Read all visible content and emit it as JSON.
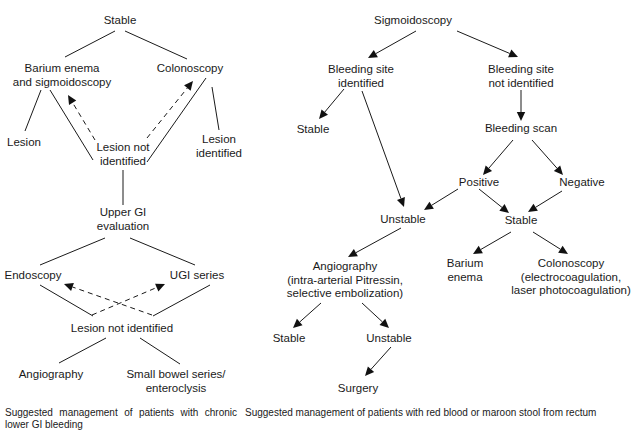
{
  "figures": [
    {
      "id": "left",
      "title": "Chronic lower GI bleeding management",
      "caption": "Suggested management of patients with chronic lower GI bleeding",
      "nodes": [
        {
          "id": "L_stable",
          "lines": [
            "Stable"
          ]
        },
        {
          "id": "L_barium",
          "lines": [
            "Barium enema",
            "and sigmoidoscopy"
          ]
        },
        {
          "id": "L_colon",
          "lines": [
            "Colonoscopy"
          ]
        },
        {
          "id": "L_lesion",
          "lines": [
            "Lesion"
          ]
        },
        {
          "id": "L_lni1",
          "lines": [
            "Lesion not",
            "identified"
          ]
        },
        {
          "id": "L_lid",
          "lines": [
            "Lesion",
            "identified"
          ]
        },
        {
          "id": "L_ugi",
          "lines": [
            "Upper GI",
            "evaluation"
          ]
        },
        {
          "id": "L_endo",
          "lines": [
            "Endoscopy"
          ]
        },
        {
          "id": "L_ugiser",
          "lines": [
            "UGI series"
          ]
        },
        {
          "id": "L_lni2",
          "lines": [
            "Lesion not identified"
          ]
        },
        {
          "id": "L_angio",
          "lines": [
            "Angiography"
          ]
        },
        {
          "id": "L_sbs",
          "lines": [
            "Small bowel series/",
            "enteroclysis"
          ]
        }
      ],
      "edges": [
        {
          "from": "L_stable",
          "to": "L_barium",
          "style": "solid",
          "arrow": false
        },
        {
          "from": "L_stable",
          "to": "L_colon",
          "style": "solid",
          "arrow": false
        },
        {
          "from": "L_barium",
          "to": "L_lesion",
          "style": "solid",
          "arrow": false
        },
        {
          "from": "L_barium",
          "to": "L_lni1",
          "style": "solid",
          "arrow": false
        },
        {
          "from": "L_colon",
          "to": "L_lni1",
          "style": "solid",
          "arrow": false
        },
        {
          "from": "L_colon",
          "to": "L_lid",
          "style": "solid",
          "arrow": false
        },
        {
          "from": "L_lni1",
          "to": "L_barium",
          "style": "dashed",
          "arrow": true
        },
        {
          "from": "L_lni1",
          "to": "L_colon",
          "style": "dashed",
          "arrow": true
        },
        {
          "from": "L_lni1",
          "to": "L_ugi",
          "style": "solid",
          "arrow": false
        },
        {
          "from": "L_ugi",
          "to": "L_endo",
          "style": "solid",
          "arrow": false
        },
        {
          "from": "L_ugi",
          "to": "L_ugiser",
          "style": "solid",
          "arrow": false
        },
        {
          "from": "L_endo",
          "to": "L_lni2",
          "style": "solid",
          "arrow": false
        },
        {
          "from": "L_ugiser",
          "to": "L_lni2",
          "style": "solid",
          "arrow": false
        },
        {
          "from": "L_lni2",
          "to": "L_endo",
          "style": "dashed",
          "arrow": true
        },
        {
          "from": "L_lni2",
          "to": "L_ugiser",
          "style": "dashed",
          "arrow": true
        },
        {
          "from": "L_lni2",
          "to": "L_angio",
          "style": "solid",
          "arrow": false
        },
        {
          "from": "L_lni2",
          "to": "L_sbs",
          "style": "solid",
          "arrow": false
        }
      ]
    },
    {
      "id": "right",
      "title": "Red blood or maroon stool management",
      "caption": "Suggested management of patients with red blood or maroon stool from rectum",
      "nodes": [
        {
          "id": "R_sig",
          "lines": [
            "Sigmoidoscopy"
          ]
        },
        {
          "id": "R_bsi",
          "lines": [
            "Bleeding site",
            "identified"
          ]
        },
        {
          "id": "R_bsni",
          "lines": [
            "Bleeding site",
            "not identified"
          ]
        },
        {
          "id": "R_stable1",
          "lines": [
            "Stable"
          ]
        },
        {
          "id": "R_scan",
          "lines": [
            "Bleeding scan"
          ]
        },
        {
          "id": "R_pos",
          "lines": [
            "Positive"
          ]
        },
        {
          "id": "R_neg",
          "lines": [
            "Negative"
          ]
        },
        {
          "id": "R_unstable1",
          "lines": [
            "Unstable"
          ]
        },
        {
          "id": "R_stable2",
          "lines": [
            "Stable"
          ]
        },
        {
          "id": "R_angio",
          "lines": [
            "Angiography",
            "(intra-arterial Pitressin,",
            "selective embolization)"
          ]
        },
        {
          "id": "R_barium",
          "lines": [
            "Barium",
            "enema"
          ]
        },
        {
          "id": "R_colon",
          "lines": [
            "Colonoscopy",
            "(electrocoagulation,",
            "laser photocoagulation)"
          ]
        },
        {
          "id": "R_stable3",
          "lines": [
            "Stable"
          ]
        },
        {
          "id": "R_unstable2",
          "lines": [
            "Unstable"
          ]
        },
        {
          "id": "R_surgery",
          "lines": [
            "Surgery"
          ]
        }
      ],
      "edges": [
        {
          "from": "R_sig",
          "to": "R_bsi",
          "style": "solid",
          "arrow": true
        },
        {
          "from": "R_sig",
          "to": "R_bsni",
          "style": "solid",
          "arrow": true
        },
        {
          "from": "R_bsi",
          "to": "R_stable1",
          "style": "solid",
          "arrow": true
        },
        {
          "from": "R_bsi",
          "to": "R_unstable1",
          "style": "solid",
          "arrow": true
        },
        {
          "from": "R_bsni",
          "to": "R_scan",
          "style": "solid",
          "arrow": true
        },
        {
          "from": "R_scan",
          "to": "R_pos",
          "style": "solid",
          "arrow": true
        },
        {
          "from": "R_scan",
          "to": "R_neg",
          "style": "solid",
          "arrow": true
        },
        {
          "from": "R_pos",
          "to": "R_unstable1",
          "style": "solid",
          "arrow": true
        },
        {
          "from": "R_pos",
          "to": "R_stable2",
          "style": "solid",
          "arrow": true
        },
        {
          "from": "R_neg",
          "to": "R_stable2",
          "style": "solid",
          "arrow": true
        },
        {
          "from": "R_unstable1",
          "to": "R_angio",
          "style": "solid",
          "arrow": true
        },
        {
          "from": "R_stable2",
          "to": "R_barium",
          "style": "solid",
          "arrow": true
        },
        {
          "from": "R_stable2",
          "to": "R_colon",
          "style": "solid",
          "arrow": true
        },
        {
          "from": "R_angio",
          "to": "R_stable3",
          "style": "solid",
          "arrow": true
        },
        {
          "from": "R_angio",
          "to": "R_unstable2",
          "style": "solid",
          "arrow": true
        },
        {
          "from": "R_unstable2",
          "to": "R_surgery",
          "style": "solid",
          "arrow": true
        }
      ]
    }
  ]
}
